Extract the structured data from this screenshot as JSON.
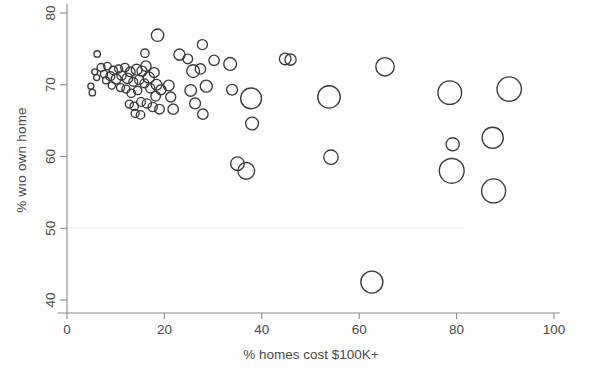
{
  "chart_data": {
    "type": "scatter",
    "title": "",
    "subtitle": "",
    "xlabel": "% homes cost $100K+",
    "ylabel": "% wıo own home",
    "xlim": [
      0,
      100
    ],
    "ylim": [
      38,
      81
    ],
    "xticks": [
      0,
      20,
      40,
      60,
      80,
      100
    ],
    "yticks": [
      40,
      50,
      60,
      70,
      80
    ],
    "xtick_labels": [
      "0",
      "20",
      "40",
      "60",
      "80",
      "100"
    ],
    "ytick_labels": [
      "40",
      "50",
      "60",
      "70",
      "80"
    ],
    "grid": false,
    "legend": "none",
    "marker_style": "open-circle",
    "marker_encoding": "bubble size encodes a third variable (population weight)",
    "series": [
      {
        "name": "metro areas",
        "points": [
          {
            "x": 6.2,
            "y": 74.3,
            "r": 3.2
          },
          {
            "x": 5.7,
            "y": 71.8,
            "r": 3.0
          },
          {
            "x": 6.1,
            "y": 71.0,
            "r": 3.0
          },
          {
            "x": 7.0,
            "y": 72.4,
            "r": 4.0
          },
          {
            "x": 7.6,
            "y": 71.5,
            "r": 3.6
          },
          {
            "x": 8.3,
            "y": 72.6,
            "r": 3.8
          },
          {
            "x": 8.0,
            "y": 70.6,
            "r": 3.4
          },
          {
            "x": 8.9,
            "y": 71.2,
            "r": 4.4
          },
          {
            "x": 9.5,
            "y": 72.0,
            "r": 4.2
          },
          {
            "x": 9.2,
            "y": 69.9,
            "r": 3.6
          },
          {
            "x": 10.1,
            "y": 70.8,
            "r": 5.0
          },
          {
            "x": 10.6,
            "y": 72.2,
            "r": 4.0
          },
          {
            "x": 11.2,
            "y": 71.3,
            "r": 4.6
          },
          {
            "x": 11.0,
            "y": 69.6,
            "r": 4.0
          },
          {
            "x": 4.9,
            "y": 69.8,
            "r": 3.0
          },
          {
            "x": 5.2,
            "y": 68.9,
            "r": 3.2
          },
          {
            "x": 11.9,
            "y": 72.4,
            "r": 4.2
          },
          {
            "x": 12.4,
            "y": 70.9,
            "r": 5.2
          },
          {
            "x": 12.1,
            "y": 69.4,
            "r": 4.0
          },
          {
            "x": 13.0,
            "y": 71.8,
            "r": 4.8
          },
          {
            "x": 13.6,
            "y": 70.4,
            "r": 4.4
          },
          {
            "x": 13.2,
            "y": 68.8,
            "r": 4.2
          },
          {
            "x": 14.3,
            "y": 72.1,
            "r": 5.4
          },
          {
            "x": 14.8,
            "y": 70.7,
            "r": 4.6
          },
          {
            "x": 14.5,
            "y": 69.2,
            "r": 4.2
          },
          {
            "x": 15.4,
            "y": 71.9,
            "r": 5.0
          },
          {
            "x": 15.9,
            "y": 70.2,
            "r": 4.4
          },
          {
            "x": 16.2,
            "y": 72.6,
            "r": 5.2
          },
          {
            "x": 16.8,
            "y": 71.0,
            "r": 5.6
          },
          {
            "x": 17.1,
            "y": 69.5,
            "r": 4.6
          },
          {
            "x": 12.8,
            "y": 67.3,
            "r": 4.0
          },
          {
            "x": 13.8,
            "y": 67.0,
            "r": 4.2
          },
          {
            "x": 15.2,
            "y": 67.6,
            "r": 4.4
          },
          {
            "x": 16.4,
            "y": 67.4,
            "r": 4.6
          },
          {
            "x": 17.9,
            "y": 71.7,
            "r": 5.0
          },
          {
            "x": 18.4,
            "y": 70.0,
            "r": 5.4
          },
          {
            "x": 18.2,
            "y": 68.4,
            "r": 4.8
          },
          {
            "x": 19.3,
            "y": 69.3,
            "r": 5.0
          },
          {
            "x": 17.6,
            "y": 66.9,
            "r": 4.6
          },
          {
            "x": 19.0,
            "y": 66.6,
            "r": 4.8
          },
          {
            "x": 14.0,
            "y": 66.0,
            "r": 4.0
          },
          {
            "x": 15.1,
            "y": 65.8,
            "r": 4.2
          },
          {
            "x": 18.6,
            "y": 76.9,
            "r": 6.2
          },
          {
            "x": 16.0,
            "y": 74.4,
            "r": 4.2
          },
          {
            "x": 20.9,
            "y": 69.9,
            "r": 5.4
          },
          {
            "x": 21.3,
            "y": 68.3,
            "r": 5.0
          },
          {
            "x": 21.8,
            "y": 66.6,
            "r": 5.2
          },
          {
            "x": 23.1,
            "y": 74.2,
            "r": 5.6
          },
          {
            "x": 24.8,
            "y": 73.6,
            "r": 4.8
          },
          {
            "x": 25.9,
            "y": 71.9,
            "r": 6.4
          },
          {
            "x": 25.4,
            "y": 69.2,
            "r": 5.8
          },
          {
            "x": 26.3,
            "y": 67.4,
            "r": 5.4
          },
          {
            "x": 27.8,
            "y": 75.6,
            "r": 5.0
          },
          {
            "x": 27.4,
            "y": 72.2,
            "r": 5.2
          },
          {
            "x": 28.6,
            "y": 69.8,
            "r": 6.0
          },
          {
            "x": 27.9,
            "y": 65.9,
            "r": 5.2
          },
          {
            "x": 30.2,
            "y": 73.4,
            "r": 5.2
          },
          {
            "x": 33.5,
            "y": 72.9,
            "r": 6.4
          },
          {
            "x": 33.9,
            "y": 69.3,
            "r": 5.4
          },
          {
            "x": 35.0,
            "y": 59.0,
            "r": 6.8
          },
          {
            "x": 36.8,
            "y": 58.0,
            "r": 8.4
          },
          {
            "x": 37.8,
            "y": 68.1,
            "r": 10.4
          },
          {
            "x": 38.0,
            "y": 64.6,
            "r": 6.4
          },
          {
            "x": 44.8,
            "y": 73.6,
            "r": 5.8
          },
          {
            "x": 45.9,
            "y": 73.5,
            "r": 5.6
          },
          {
            "x": 53.8,
            "y": 68.3,
            "r": 11.2
          },
          {
            "x": 54.2,
            "y": 59.9,
            "r": 7.2
          },
          {
            "x": 62.6,
            "y": 42.5,
            "r": 11.0
          },
          {
            "x": 65.3,
            "y": 72.5,
            "r": 9.2
          },
          {
            "x": 78.6,
            "y": 68.9,
            "r": 11.8
          },
          {
            "x": 79.2,
            "y": 61.7,
            "r": 6.6
          },
          {
            "x": 79.0,
            "y": 58.0,
            "r": 12.4
          },
          {
            "x": 87.4,
            "y": 62.6,
            "r": 10.6
          },
          {
            "x": 87.6,
            "y": 55.2,
            "r": 12.0
          },
          {
            "x": 90.8,
            "y": 69.4,
            "r": 12.2
          }
        ]
      }
    ]
  },
  "axis": {
    "x_title": "% homes cost $100K+",
    "y_title": "% wıo own home",
    "x_labels": [
      "0",
      "20",
      "40",
      "60",
      "80",
      "100"
    ],
    "y_labels": [
      "40",
      "50",
      "60",
      "70",
      "80"
    ]
  },
  "colors": {
    "marker_stroke": "#3a3a3a",
    "axis": "#8b8b8b",
    "text": "#4a4a4a",
    "background": "#fdfdfd"
  }
}
